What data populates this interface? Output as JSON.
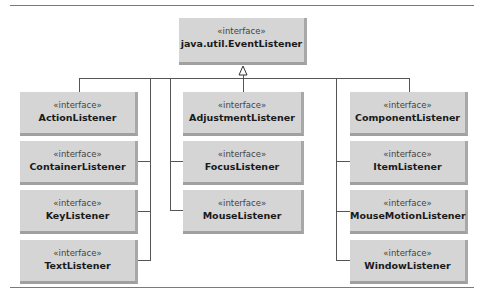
{
  "diagram": {
    "type": "UML class hierarchy",
    "stereotype": "«interface»",
    "root": {
      "stereotype": "«interface»",
      "name": "java.util.EventListener"
    },
    "columns": [
      {
        "items": [
          {
            "stereotype": "«interface»",
            "name": "ActionListener"
          },
          {
            "stereotype": "«interface»",
            "name": "ContainerListener"
          },
          {
            "stereotype": "«interface»",
            "name": "KeyListener"
          },
          {
            "stereotype": "«interface»",
            "name": "TextListener"
          }
        ]
      },
      {
        "items": [
          {
            "stereotype": "«interface»",
            "name": "AdjustmentListener"
          },
          {
            "stereotype": "«interface»",
            "name": "FocusListener"
          },
          {
            "stereotype": "«interface»",
            "name": "MouseListener"
          }
        ]
      },
      {
        "items": [
          {
            "stereotype": "«interface»",
            "name": "ComponentListener"
          },
          {
            "stereotype": "«interface»",
            "name": "ItemListener"
          },
          {
            "stereotype": "«interface»",
            "name": "MouseMotionListener"
          },
          {
            "stereotype": "«interface»",
            "name": "WindowListener"
          }
        ]
      }
    ],
    "relationship": "generalization (hollow triangle arrow to root)",
    "colors": {
      "box_fill": "#d5d5d5",
      "box_shadow": "#a0a0a0",
      "line": "#555555",
      "rule": "#7a7a7a"
    }
  }
}
